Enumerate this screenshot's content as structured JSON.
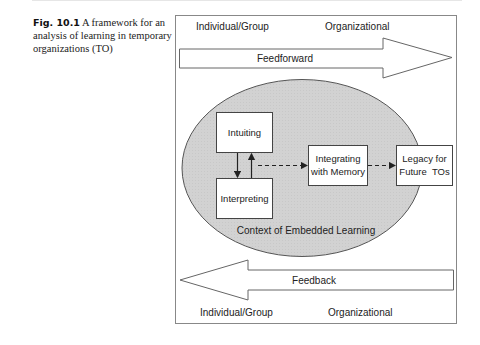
{
  "caption": {
    "label": "Fig. 10.1",
    "text": "A framework for an analysis of learning in temporary organizations (TO)"
  },
  "diagram": {
    "top_labels": {
      "left": "Individual/Group",
      "right": "Organizational"
    },
    "bottom_labels": {
      "left": "Individual/Group",
      "right": "Organizational"
    },
    "feedforward_arrow": {
      "label": "Feedforward",
      "direction": "right"
    },
    "feedback_arrow": {
      "label": "Feedback",
      "direction": "left"
    },
    "context": {
      "label": "Context of Embedded Learning",
      "fill": "#d4d4d4"
    },
    "boxes": {
      "intuiting": "Intuiting",
      "interpreting": "Interpreting",
      "integrating_line1": "Integrating",
      "integrating_line2": "with Memory",
      "legacy_line1": "Legacy for",
      "legacy_line2": "Future  TOs"
    },
    "colors": {
      "stroke": "#555555",
      "frame": "#888888",
      "ellipse_fill": "#d4d4d4"
    }
  }
}
